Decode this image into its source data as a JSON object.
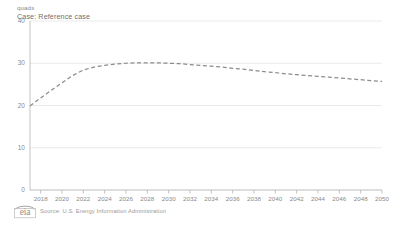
{
  "chart_data": {
    "type": "line",
    "title": "",
    "unit_label": "quads",
    "case_label": "Case: Reference case",
    "xlabel": "",
    "ylabel": "quads",
    "ylim": [
      0,
      40
    ],
    "xlim": [
      2017,
      2050
    ],
    "grid": true,
    "legend": "none",
    "y_ticks": [
      "0",
      "10",
      "20",
      "30",
      "40"
    ],
    "y_tick_values": [
      0,
      10,
      20,
      30,
      40
    ],
    "x_ticks": [
      "2018",
      "2020",
      "2022",
      "2024",
      "2026",
      "2028",
      "2030",
      "2032",
      "2034",
      "2036",
      "2038",
      "2040",
      "2042",
      "2044",
      "2046",
      "2048",
      "2050"
    ],
    "x_tick_values": [
      2018,
      2020,
      2022,
      2024,
      2026,
      2028,
      2030,
      2032,
      2034,
      2036,
      2038,
      2040,
      2042,
      2044,
      2046,
      2048,
      2050
    ],
    "line_style": "dashed",
    "line_color": "#8c8c8c",
    "grid_color": "#e4e4e4",
    "axis_color": "#b4b4b4",
    "series": [
      {
        "name": "Reference case",
        "x": [
          2017,
          2018,
          2019,
          2020,
          2021,
          2022,
          2023,
          2024,
          2025,
          2026,
          2027,
          2028,
          2029,
          2030,
          2031,
          2032,
          2033,
          2034,
          2035,
          2036,
          2037,
          2038,
          2039,
          2040,
          2041,
          2042,
          2043,
          2044,
          2045,
          2046,
          2047,
          2048,
          2049,
          2050
        ],
        "values": [
          19.9,
          21.8,
          23.6,
          25.4,
          27.1,
          28.4,
          29.1,
          29.5,
          29.8,
          30.0,
          30.1,
          30.1,
          30.1,
          30.0,
          29.9,
          29.7,
          29.5,
          29.3,
          29.1,
          28.8,
          28.6,
          28.3,
          28.0,
          27.8,
          27.5,
          27.3,
          27.1,
          26.9,
          26.7,
          26.5,
          26.3,
          26.1,
          25.9,
          25.7
        ]
      }
    ]
  },
  "footer": {
    "source_text": "Source: U.S. Energy Information Administration",
    "logo_text": "eia"
  }
}
